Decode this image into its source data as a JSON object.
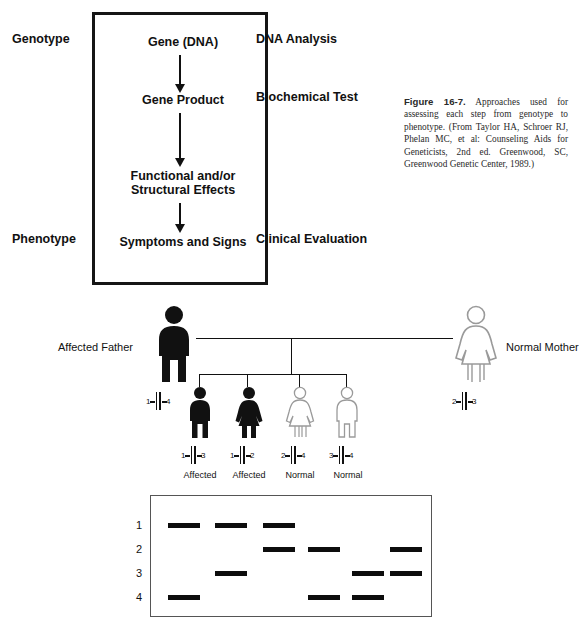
{
  "figure": {
    "caption_label": "Figure 16-7.",
    "caption_text": " Approaches used for assessing each step from genotype to phenotype. (From Taylor HA, Schroer RJ, Phelan MC, et al: Counseling Aids for Geneticists, 2nd ed. Greenwood, SC, Greenwood Genetic Center, 1989.)"
  },
  "flowchart": {
    "left_labels": [
      {
        "text": "Genotype",
        "top": 32
      },
      {
        "text": "Phenotype",
        "top": 222
      }
    ],
    "nodes": [
      {
        "text": "Gene (DNA)",
        "top": 32
      },
      {
        "text": "Gene Product",
        "top": 90
      },
      {
        "text": "Functional and/or",
        "top": 166
      },
      {
        "text": "Structural Effects",
        "top": 180
      },
      {
        "text": "Symptoms and Signs",
        "top": 222
      }
    ],
    "arrows": [
      {
        "top": 52,
        "height": 30
      },
      {
        "top": 110,
        "height": 48
      },
      {
        "top": 200,
        "height": 14
      }
    ],
    "right_labels": [
      {
        "text": "DNA Analysis",
        "top": 32
      },
      {
        "text": "Biochemical Test",
        "top": 90
      },
      {
        "text": "Clinical Evaluation",
        "top": 222
      }
    ]
  },
  "pedigree": {
    "father": {
      "label": "Affected Father",
      "sex": "male",
      "filled": true,
      "alleles": {
        "left": "1",
        "right": "4"
      }
    },
    "mother": {
      "label": "Normal Mother",
      "sex": "female",
      "filled": false,
      "alleles": {
        "left": "2",
        "right": "3"
      }
    },
    "children": [
      {
        "status": "Affected",
        "sex": "male",
        "filled": true,
        "alleles": {
          "left": "1",
          "right": "3"
        }
      },
      {
        "status": "Affected",
        "sex": "female",
        "filled": true,
        "alleles": {
          "left": "1",
          "right": "2"
        }
      },
      {
        "status": "Normal",
        "sex": "female",
        "filled": false,
        "alleles": {
          "left": "2",
          "right": "4"
        }
      },
      {
        "status": "Normal",
        "sex": "male",
        "filled": false,
        "alleles": {
          "left": "3",
          "right": "4"
        }
      }
    ]
  },
  "gel": {
    "row_labels": [
      "1",
      "2",
      "3",
      "4"
    ],
    "lanes": [
      {
        "name": "father",
        "bands": [
          1,
          4
        ]
      },
      {
        "name": "child-1",
        "bands": [
          1,
          3
        ]
      },
      {
        "name": "child-2",
        "bands": [
          1,
          2
        ]
      },
      {
        "name": "child-3",
        "bands": [
          2,
          4
        ]
      },
      {
        "name": "child-4",
        "bands": [
          3,
          4
        ]
      },
      {
        "name": "mother",
        "bands": [
          2,
          3
        ]
      }
    ]
  },
  "colors": {
    "ink": "#111111",
    "outline": "#9a9a9a",
    "gel_border": "#555555"
  }
}
